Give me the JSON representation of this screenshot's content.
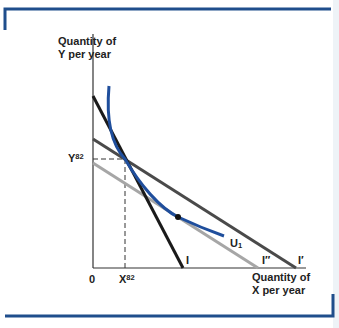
{
  "diagram": {
    "title": "",
    "y_axis_label": [
      "Quantity of",
      "Y per year"
    ],
    "x_axis_label": [
      "Quantity of",
      "X per year"
    ],
    "origin_label": "0",
    "y_mark": {
      "base": "Y",
      "sup": "82"
    },
    "x_mark": {
      "base": "X",
      "sup": "82"
    },
    "indifference_curve": {
      "base": "U",
      "sub": "1"
    },
    "budget_lines": [
      {
        "label": "I",
        "color": "#1a1a1a"
      },
      {
        "label": "I″",
        "color": "#a6a6a6"
      },
      {
        "label": "I′",
        "color": "#4a4a4a"
      }
    ],
    "colors": {
      "frame": "#1f4e8c",
      "curve": "#1f4e9c",
      "axis": "#333333"
    }
  }
}
